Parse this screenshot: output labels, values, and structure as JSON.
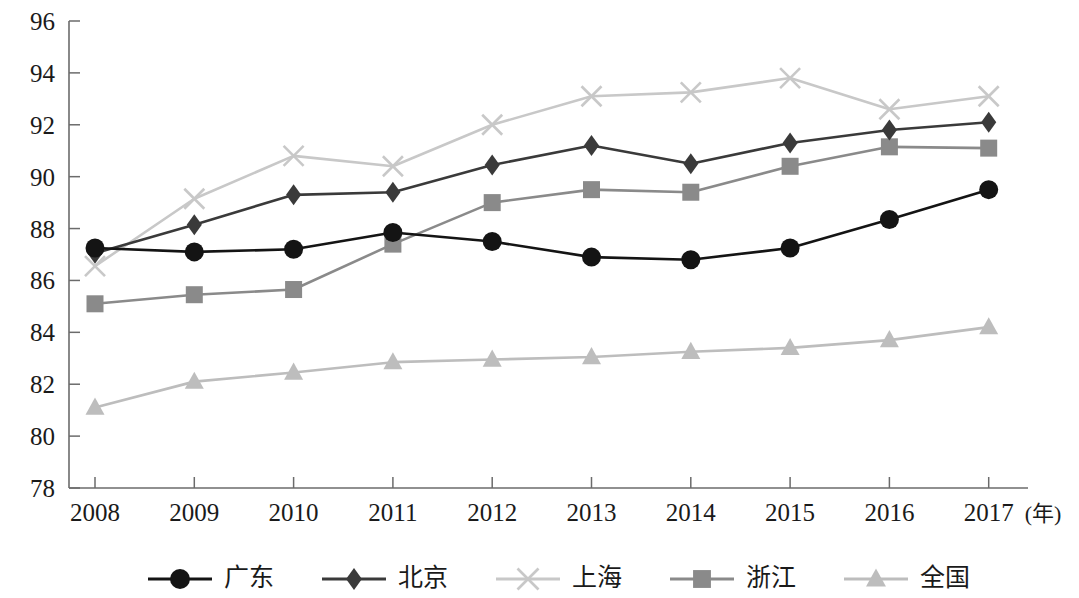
{
  "chart_data": {
    "type": "line",
    "title": "",
    "xlabel": "年",
    "ylabel": "",
    "x": [
      2008,
      2009,
      2010,
      2011,
      2012,
      2013,
      2014,
      2015,
      2016,
      2017
    ],
    "xtick_labels": [
      "2008",
      "2009",
      "2010",
      "2011",
      "2012",
      "2013",
      "2014",
      "2015",
      "2016",
      "2017"
    ],
    "x_unit_label": "(年)",
    "ylim": [
      78,
      96
    ],
    "ytick_labels": [
      "78",
      "80",
      "82",
      "84",
      "86",
      "88",
      "90",
      "92",
      "94",
      "96"
    ],
    "yticks": [
      78,
      80,
      82,
      84,
      86,
      88,
      90,
      92,
      94,
      96
    ],
    "grid": false,
    "legend_position": "bottom",
    "series": [
      {
        "name": "广东",
        "marker": "circle",
        "color": "#141414",
        "values": [
          87.25,
          87.1,
          87.2,
          87.85,
          87.5,
          86.9,
          86.8,
          87.25,
          88.35,
          89.5
        ]
      },
      {
        "name": "北京",
        "marker": "diamond",
        "color": "#3a3a3a",
        "values": [
          87.05,
          88.15,
          89.3,
          89.4,
          90.45,
          91.2,
          90.5,
          91.3,
          91.8,
          92.1
        ]
      },
      {
        "name": "上海",
        "marker": "cross",
        "color": "#c8c8c8",
        "values": [
          86.55,
          89.15,
          90.8,
          90.4,
          92.0,
          93.1,
          93.25,
          93.8,
          92.6,
          93.1
        ]
      },
      {
        "name": "浙江",
        "marker": "square",
        "color": "#8a8a8a",
        "values": [
          85.1,
          85.45,
          85.65,
          87.4,
          89.0,
          89.5,
          89.4,
          90.4,
          91.15,
          91.1
        ]
      },
      {
        "name": "全国",
        "marker": "triangle",
        "color": "#bdbdbd",
        "values": [
          81.1,
          82.1,
          82.45,
          82.85,
          82.95,
          83.05,
          83.25,
          83.4,
          83.7,
          84.2
        ]
      }
    ]
  },
  "legend": {
    "items": [
      {
        "label": "广东",
        "marker": "circle",
        "color": "#141414"
      },
      {
        "label": "北京",
        "marker": "diamond",
        "color": "#3a3a3a"
      },
      {
        "label": "上海",
        "marker": "cross",
        "color": "#c8c8c8"
      },
      {
        "label": "浙江",
        "marker": "square",
        "color": "#8a8a8a"
      },
      {
        "label": "全国",
        "marker": "triangle",
        "color": "#bdbdbd"
      }
    ]
  }
}
